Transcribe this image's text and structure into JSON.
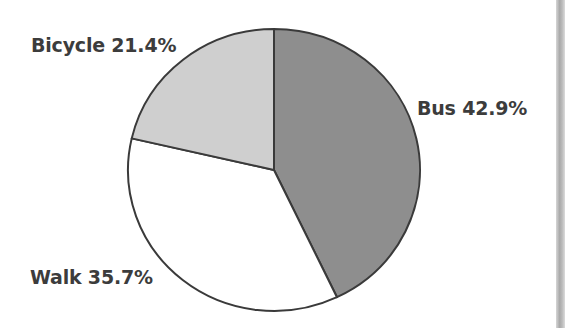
{
  "chart_data": {
    "type": "pie",
    "title": "",
    "slices": [
      {
        "label": "Bus",
        "value": 42.9,
        "color": "#8e8e8e"
      },
      {
        "label": "Walk",
        "value": 35.7,
        "color": "#ffffff"
      },
      {
        "label": "Bicycle",
        "value": 21.4,
        "color": "#cfcfcf"
      }
    ],
    "start_angle_deg": 0,
    "direction": "clockwise from 12 o'clock",
    "legend": "none (direct labels)"
  },
  "labels": {
    "bus": "Bus 42.9%",
    "walk": "Walk 35.7%",
    "bicycle": "Bicycle 21.4%"
  },
  "colors": {
    "stroke": "#3a3a3a",
    "text": "#3c3c3c"
  }
}
